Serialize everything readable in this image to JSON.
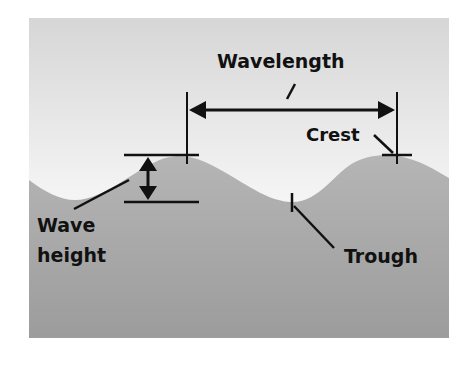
{
  "diagram": {
    "labels": {
      "wavelength": "Wavelength",
      "crest": "Crest",
      "trough": "Trough",
      "wave_height_line1": "Wave",
      "wave_height_line2": "height"
    },
    "colors": {
      "sky_top": "#d9d9d9",
      "sky_bottom": "#ffffff",
      "water_top": "#b3b3b3",
      "water_bottom": "#9a9a9a",
      "ink": "#111111",
      "page_background": "#ffffff"
    }
  }
}
